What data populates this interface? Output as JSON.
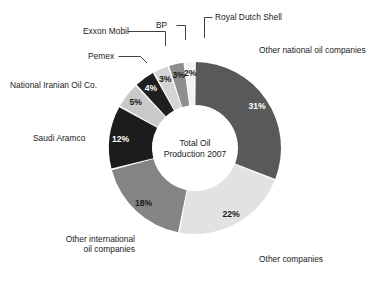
{
  "chart_data": {
    "type": "pie",
    "variant": "donut",
    "title": "",
    "center_label_lines": [
      "Total Oil",
      "Production 2007"
    ],
    "xlabel": "",
    "ylabel": "",
    "units": "percent",
    "legend": "none (direct labels with leader lines)",
    "grid": false,
    "categories": [
      "Other national oil companies",
      "Other companies",
      "Other international oil companies",
      "Saudi Aramco",
      "National Iranian Oil Co.",
      "Pemex",
      "Exxon Mobil",
      "BP",
      "Royal Dutch Shell"
    ],
    "values": [
      31,
      22,
      18,
      12,
      5,
      4,
      3,
      3,
      2
    ],
    "value_labels": [
      "31%",
      "22%",
      "18%",
      "12%",
      "5%",
      "4%",
      "3%",
      "3%",
      "2%"
    ],
    "colors": [
      "#595959",
      "#e2e2e2",
      "#848484",
      "#1c1c1c",
      "#c9c9c9",
      "#1f1f1f",
      "#d4d4d4",
      "#8e8e8e",
      "#f2f2f2"
    ],
    "slice_label_colors": [
      "#ffffff",
      "#1a1a1a",
      "#1a1a1a",
      "#ffffff",
      "#1a1a1a",
      "#ffffff",
      "#1a1a1a",
      "#1a1a1a",
      "#1a1a1a"
    ],
    "start_angle_deg": 0,
    "direction": "clockwise",
    "separator_color": "#ffffff"
  },
  "labels": {
    "royal_dutch_shell": "Royal Dutch Shell",
    "bp": "BP",
    "exxon_mobil": "Exxon Mobil",
    "pemex": "Pemex",
    "national_iranian": "National Iranian Oil Co.",
    "saudi_aramco": "Saudi Aramco",
    "other_international": "Other international\noil companies",
    "other_companies": "Other companies",
    "other_national": "Other national oil companies"
  },
  "slice_percentages": {
    "other_national": "31%",
    "other_companies": "22%",
    "other_international": "18%",
    "saudi_aramco": "12%",
    "national_iranian": "5%",
    "pemex": "4%",
    "exxon_mobil": "3%",
    "bp": "3%",
    "royal_dutch_shell": "2%"
  },
  "center": {
    "line1": "Total Oil",
    "line2": "Production 2007"
  },
  "colors": {
    "background": "#ffffff",
    "text": "#1a1a1a",
    "leader_line": "#2b2b2b"
  }
}
